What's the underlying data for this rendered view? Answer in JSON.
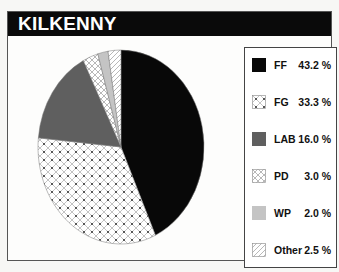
{
  "title": "KILKENNY",
  "chart_data": {
    "type": "pie",
    "title": "KILKENNY",
    "categories": [
      "FF",
      "FG",
      "LAB",
      "PD",
      "WP",
      "Other"
    ],
    "values": [
      43.2,
      33.3,
      16.0,
      3.0,
      2.0,
      2.5
    ],
    "unit": "%",
    "start_angle": "top, clockwise",
    "legend_position": "right"
  },
  "legend": [
    {
      "label": "FF",
      "value": "43.2 %",
      "fill": "#080808",
      "pattern": "solid"
    },
    {
      "label": "FG",
      "value": "33.3 %",
      "fill": "#ffffff",
      "pattern": "crosshatch-dots"
    },
    {
      "label": "LAB",
      "value": "16.0 %",
      "fill": "#5f5f5f",
      "pattern": "solid"
    },
    {
      "label": "PD",
      "value": "3.0 %",
      "fill": "#ffffff",
      "pattern": "crosshatch"
    },
    {
      "label": "WP",
      "value": "2.0 %",
      "fill": "#c4c4c4",
      "pattern": "solid"
    },
    {
      "label": "Other",
      "value": "2.5 %",
      "fill": "#ffffff",
      "pattern": "diagonal"
    }
  ]
}
